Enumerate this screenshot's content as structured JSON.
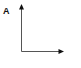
{
  "panel": {
    "label": "A"
  },
  "axes": {
    "color": "#555555",
    "arrow_color": "#111111",
    "x_axis": {
      "label": ""
    },
    "y_axis": {
      "label": ""
    }
  }
}
